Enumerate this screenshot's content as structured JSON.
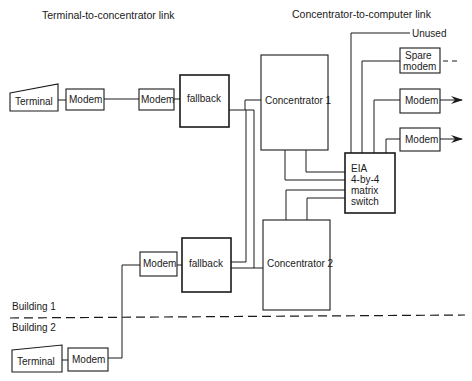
{
  "titles": {
    "left": "Terminal-to-concentrator link",
    "right": "Concentrator-to-computer link"
  },
  "building1": {
    "label": "Building 1",
    "terminal_label": "Terminal",
    "modem_local_label": "Modem",
    "modem_remote_label": "Modem",
    "fallback_label": "fallback"
  },
  "building2": {
    "label": "Building 2",
    "terminal_label": "Terminal",
    "modem_local_label": "Modem",
    "modem_remote_label": "Modem",
    "fallback_label": "fallback"
  },
  "concentrators": [
    {
      "label": "Concentrator 1"
    },
    {
      "label": "Concentrator 2"
    }
  ],
  "switch": {
    "lines": [
      "EIA",
      "4-by-4",
      "matrix",
      "switch"
    ]
  },
  "outputs": {
    "unused_label": "Unused",
    "spare_modem_lines": [
      "Spare",
      "modem"
    ],
    "modem_a_label": "Modem",
    "modem_b_label": "Modem"
  },
  "colors": {
    "ink": "#1a1a1a",
    "background": "#ffffff"
  }
}
